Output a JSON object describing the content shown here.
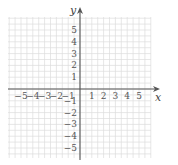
{
  "chart_data": {
    "type": "coordinate-plane",
    "title": "",
    "xlabel": "x",
    "ylabel": "y",
    "xlim": [
      -6,
      6
    ],
    "ylim": [
      -6,
      6
    ],
    "grid": true,
    "minor_grid_per_unit": 2,
    "x_tick_labels": [
      "−5",
      "−4",
      "−3",
      "−2",
      "−1",
      "1",
      "2",
      "3",
      "4",
      "5"
    ],
    "x_tick_values": [
      -5,
      -4,
      -3,
      -2,
      -1,
      1,
      2,
      3,
      4,
      5
    ],
    "y_tick_labels": [
      "5",
      "4",
      "3",
      "2",
      "1",
      "−1",
      "−2",
      "−3",
      "−4",
      "−5"
    ],
    "y_tick_values": [
      5,
      4,
      3,
      2,
      1,
      -1,
      -2,
      -3,
      -4,
      -5
    ],
    "series": []
  },
  "colors": {
    "grid": "#dcdcdc",
    "axis": "#555555",
    "text": "#555555"
  }
}
